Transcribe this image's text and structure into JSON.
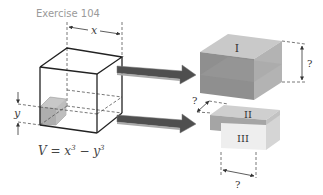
{
  "title": "Exercise 104",
  "main_cube": {
    "width_label": "x",
    "height_label": "y",
    "formula_V": "V = x",
    "formula_exp1": "3",
    "formula_minus": " − y",
    "formula_exp2": "3"
  },
  "pieces": {
    "piece1_label": "I",
    "piece2_label": "II",
    "piece3_label": "III",
    "unknown_label": "?"
  },
  "colors": {
    "arrow": "#555555",
    "piece_dark": "#8e8e8e",
    "piece_mid": "#b5b5b5",
    "piece_light": "#e6e6e6"
  }
}
